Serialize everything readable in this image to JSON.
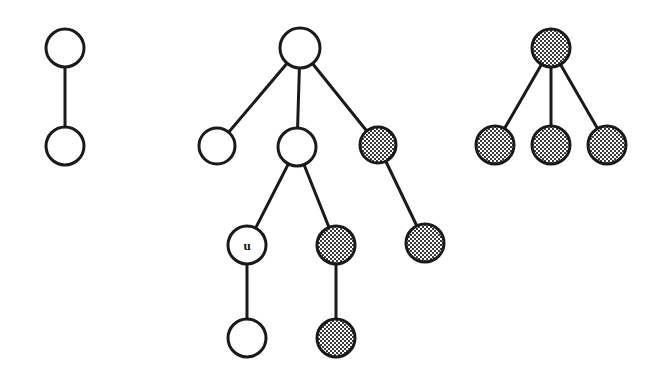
{
  "figure": {
    "background_color": "#ffffff",
    "stroke_color": "#1a1a1a",
    "node_fill_white": "#ffffff",
    "node_fill_shaded": "#808080",
    "node_stroke_width": 3,
    "edge_stroke_width": 3,
    "width": 663,
    "height": 377
  },
  "trees": [
    {
      "id": "tree-left",
      "name": "left-tree",
      "nodes": [
        {
          "id": "L0",
          "label": "",
          "fill": "white",
          "cx": 65,
          "cy": 48,
          "r": 19
        },
        {
          "id": "L1",
          "label": "",
          "fill": "white",
          "cx": 65,
          "cy": 146,
          "r": 19
        }
      ],
      "edges": [
        {
          "from": "L0",
          "to": "L1"
        }
      ]
    },
    {
      "id": "tree-middle",
      "name": "middle-tree",
      "nodes": [
        {
          "id": "M0",
          "label": "",
          "fill": "white",
          "cx": 300,
          "cy": 48,
          "r": 20
        },
        {
          "id": "M1",
          "label": "",
          "fill": "white",
          "cx": 217,
          "cy": 146,
          "r": 18
        },
        {
          "id": "M2",
          "label": "",
          "fill": "white",
          "cx": 297,
          "cy": 147,
          "r": 19
        },
        {
          "id": "M3",
          "label": "",
          "fill": "shaded",
          "cx": 378,
          "cy": 145,
          "r": 18
        },
        {
          "id": "M4",
          "label": "u",
          "fill": "white",
          "cx": 247,
          "cy": 245,
          "r": 19
        },
        {
          "id": "M5",
          "label": "",
          "fill": "shaded",
          "cx": 336,
          "cy": 245,
          "r": 19
        },
        {
          "id": "M6",
          "label": "",
          "fill": "shaded",
          "cx": 425,
          "cy": 243,
          "r": 19
        },
        {
          "id": "M7",
          "label": "",
          "fill": "white",
          "cx": 247,
          "cy": 338,
          "r": 19
        },
        {
          "id": "M8",
          "label": "",
          "fill": "shaded",
          "cx": 336,
          "cy": 338,
          "r": 19
        }
      ],
      "edges": [
        {
          "from": "M0",
          "to": "M1"
        },
        {
          "from": "M0",
          "to": "M2"
        },
        {
          "from": "M0",
          "to": "M3"
        },
        {
          "from": "M2",
          "to": "M4"
        },
        {
          "from": "M2",
          "to": "M5"
        },
        {
          "from": "M3",
          "to": "M6"
        },
        {
          "from": "M4",
          "to": "M7"
        },
        {
          "from": "M5",
          "to": "M8"
        }
      ]
    },
    {
      "id": "tree-right",
      "name": "right-tree",
      "nodes": [
        {
          "id": "R0",
          "label": "",
          "fill": "shaded",
          "cx": 551,
          "cy": 48,
          "r": 19
        },
        {
          "id": "R1",
          "label": "",
          "fill": "shaded",
          "cx": 495,
          "cy": 145,
          "r": 19
        },
        {
          "id": "R2",
          "label": "",
          "fill": "shaded",
          "cx": 551,
          "cy": 145,
          "r": 19
        },
        {
          "id": "R3",
          "label": "",
          "fill": "shaded",
          "cx": 607,
          "cy": 145,
          "r": 19
        }
      ],
      "edges": [
        {
          "from": "R0",
          "to": "R1"
        },
        {
          "from": "R0",
          "to": "R2"
        },
        {
          "from": "R0",
          "to": "R3"
        }
      ]
    }
  ],
  "labels": [
    {
      "text": "u",
      "node_id": "M4"
    }
  ]
}
